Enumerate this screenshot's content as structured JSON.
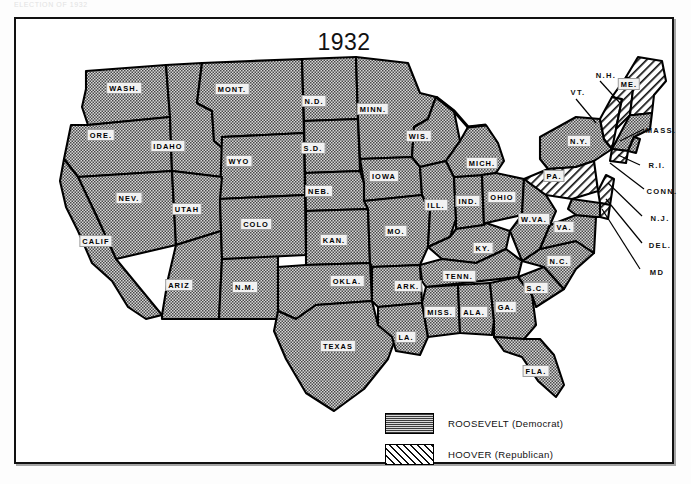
{
  "page": {
    "caption": "ELECTION OF 1932",
    "title": "1932"
  },
  "legend": {
    "items": [
      {
        "label": "ROOSEVELT (Democrat)",
        "pattern": "stipple",
        "party": "Democrat",
        "candidate": "ROOSEVELT"
      },
      {
        "label": "HOOVER (Republican)",
        "pattern": "diagonal-hatch",
        "party": "Republican",
        "candidate": "HOOVER"
      }
    ]
  },
  "colors": {
    "ink": "#111111",
    "paper": "#ffffff",
    "democrat_fill": "#c9c9c9",
    "republican_fill": "#ffffff",
    "label_box": "#f2f2f2"
  },
  "map": {
    "inset_labels": [
      {
        "abbr": "N.H.",
        "x": 590,
        "y": 56,
        "leader_to": [
          601,
          84
        ]
      },
      {
        "abbr": "VT.",
        "x": 562,
        "y": 73,
        "leader_to": [
          577,
          103
        ]
      },
      {
        "abbr": "MASS.",
        "x": 645,
        "y": 111,
        "leader_to": [
          611,
          126
        ]
      },
      {
        "abbr": "R.I.",
        "x": 641,
        "y": 146,
        "leader_to": [
          604,
          139
        ]
      },
      {
        "abbr": "CONN.",
        "x": 646,
        "y": 172,
        "leader_to": [
          595,
          146
        ]
      },
      {
        "abbr": "N.J.",
        "x": 644,
        "y": 199,
        "leader_to": [
          592,
          163
        ]
      },
      {
        "abbr": "DEL.",
        "x": 644,
        "y": 226,
        "leader_to": [
          589,
          178
        ]
      },
      {
        "abbr": "MD",
        "x": 641,
        "y": 253,
        "leader_to": [
          585,
          188
        ]
      }
    ],
    "states": [
      {
        "abbr": "WASH.",
        "x": 108,
        "y": 69,
        "winner": "Roosevelt"
      },
      {
        "abbr": "ORE.",
        "x": 85,
        "y": 116,
        "winner": "Roosevelt"
      },
      {
        "abbr": "IDAHO",
        "x": 152,
        "y": 127,
        "winner": "Roosevelt"
      },
      {
        "abbr": "MONT.",
        "x": 216,
        "y": 70,
        "winner": "Roosevelt"
      },
      {
        "abbr": "WYO",
        "x": 223,
        "y": 142,
        "winner": "Roosevelt"
      },
      {
        "abbr": "NEV.",
        "x": 113,
        "y": 179,
        "winner": "Roosevelt"
      },
      {
        "abbr": "UTAH",
        "x": 171,
        "y": 190,
        "winner": "Roosevelt"
      },
      {
        "abbr": "CALIF",
        "x": 80,
        "y": 222,
        "winner": "Roosevelt"
      },
      {
        "abbr": "ARIZ",
        "x": 163,
        "y": 266,
        "winner": "Roosevelt"
      },
      {
        "abbr": "N.M.",
        "x": 229,
        "y": 268,
        "winner": "Roosevelt"
      },
      {
        "abbr": "COLO",
        "x": 240,
        "y": 205,
        "winner": "Roosevelt"
      },
      {
        "abbr": "N.D.",
        "x": 298,
        "y": 82,
        "winner": "Roosevelt"
      },
      {
        "abbr": "S.D.",
        "x": 297,
        "y": 129,
        "winner": "Roosevelt"
      },
      {
        "abbr": "NEB.",
        "x": 303,
        "y": 172,
        "winner": "Roosevelt"
      },
      {
        "abbr": "KAN.",
        "x": 318,
        "y": 221,
        "winner": "Roosevelt"
      },
      {
        "abbr": "OKLA.",
        "x": 331,
        "y": 262,
        "winner": "Roosevelt"
      },
      {
        "abbr": "TEXAS",
        "x": 322,
        "y": 327,
        "winner": "Roosevelt"
      },
      {
        "abbr": "MINN.",
        "x": 357,
        "y": 90,
        "winner": "Roosevelt"
      },
      {
        "abbr": "IOWA",
        "x": 368,
        "y": 157,
        "winner": "Roosevelt"
      },
      {
        "abbr": "MO.",
        "x": 380,
        "y": 212,
        "winner": "Roosevelt"
      },
      {
        "abbr": "ARK.",
        "x": 392,
        "y": 267,
        "winner": "Roosevelt"
      },
      {
        "abbr": "LA.",
        "x": 390,
        "y": 318,
        "winner": "Roosevelt"
      },
      {
        "abbr": "WIS.",
        "x": 403,
        "y": 117,
        "winner": "Roosevelt"
      },
      {
        "abbr": "ILL.",
        "x": 420,
        "y": 186,
        "winner": "Roosevelt"
      },
      {
        "abbr": "IND.",
        "x": 452,
        "y": 182,
        "winner": "Roosevelt"
      },
      {
        "abbr": "MICH.",
        "x": 466,
        "y": 144,
        "winner": "Roosevelt"
      },
      {
        "abbr": "OHIO",
        "x": 486,
        "y": 178,
        "winner": "Roosevelt"
      },
      {
        "abbr": "KY.",
        "x": 467,
        "y": 229,
        "winner": "Roosevelt"
      },
      {
        "abbr": "TENN.",
        "x": 443,
        "y": 257,
        "winner": "Roosevelt"
      },
      {
        "abbr": "MISS.",
        "x": 424,
        "y": 293,
        "winner": "Roosevelt"
      },
      {
        "abbr": "ALA.",
        "x": 458,
        "y": 293,
        "winner": "Roosevelt"
      },
      {
        "abbr": "GA.",
        "x": 490,
        "y": 288,
        "winner": "Roosevelt"
      },
      {
        "abbr": "S.C.",
        "x": 520,
        "y": 269,
        "winner": "Roosevelt"
      },
      {
        "abbr": "N.C.",
        "x": 543,
        "y": 242,
        "winner": "Roosevelt"
      },
      {
        "abbr": "FLA.",
        "x": 520,
        "y": 352,
        "winner": "Roosevelt"
      },
      {
        "abbr": "W.VA.",
        "x": 518,
        "y": 200,
        "winner": "Roosevelt"
      },
      {
        "abbr": "VA.",
        "x": 548,
        "y": 208,
        "winner": "Roosevelt"
      },
      {
        "abbr": "N.Y.",
        "x": 563,
        "y": 122,
        "winner": "Roosevelt"
      },
      {
        "abbr": "PA.",
        "x": 538,
        "y": 157,
        "winner": "Hoover"
      },
      {
        "abbr": "ME.",
        "x": 613,
        "y": 65,
        "winner": "Hoover"
      }
    ]
  }
}
